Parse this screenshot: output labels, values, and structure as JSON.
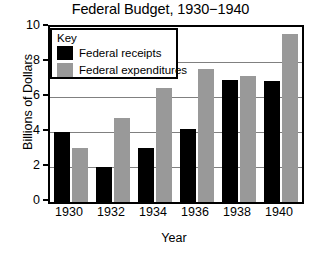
{
  "chart_data": {
    "type": "bar",
    "title": "Federal Budget, 1930−1940",
    "xlabel": "Year",
    "ylabel": "Billions of Dollars",
    "categories": [
      "1930",
      "1932",
      "1934",
      "1936",
      "1938",
      "1940"
    ],
    "series": [
      {
        "name": "Federal receipts",
        "color": "#000000",
        "values": [
          4.0,
          2.0,
          3.1,
          4.2,
          7.0,
          6.9
        ]
      },
      {
        "name": "Federal expenditures",
        "color": "#999999",
        "values": [
          3.1,
          4.8,
          6.5,
          7.6,
          7.2,
          9.6
        ]
      }
    ],
    "ylim": [
      0,
      10
    ],
    "yticks": [
      0,
      2,
      4,
      6,
      8,
      10
    ],
    "ytick_labels": [
      "0",
      "2",
      "4",
      "6",
      "8",
      "10"
    ],
    "grid": true,
    "grid_axis": "y",
    "legend_position": "upper-left-inside"
  },
  "legend": {
    "title": "Key",
    "entries": [
      {
        "label": "Federal receipts",
        "color": "#000000"
      },
      {
        "label": "Federal expenditures",
        "color": "#999999"
      }
    ]
  },
  "colors": {
    "receipts": "#000000",
    "expenditures": "#999999",
    "grid": "#808080",
    "axis": "#000000",
    "background": "#ffffff"
  }
}
